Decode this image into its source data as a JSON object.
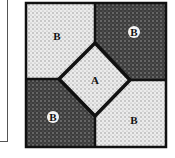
{
  "diagram": {
    "type": "quilt-block",
    "center_patch": {
      "label": "A",
      "fill": "light"
    },
    "corner_patches": [
      {
        "position": "top-left",
        "label": "B",
        "fill": "light",
        "label_style": "plain"
      },
      {
        "position": "top-right",
        "label": "B",
        "fill": "dark",
        "label_style": "circled"
      },
      {
        "position": "bottom-left",
        "label": "B",
        "fill": "dark",
        "label_style": "circled"
      },
      {
        "position": "bottom-right",
        "label": "B",
        "fill": "light",
        "label_style": "plain"
      }
    ],
    "colors": {
      "light": "#e4e4e4",
      "dark": "#4a4a4a",
      "outline": "#111111"
    }
  }
}
